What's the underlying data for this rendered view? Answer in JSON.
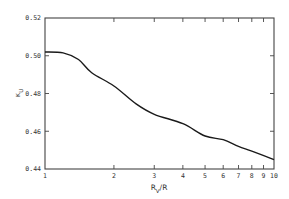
{
  "chart_data": {
    "type": "line",
    "title": "",
    "xlabel": "R_V/R",
    "ylabel": "κ_U",
    "xscale": "log",
    "xlim": [
      1,
      10
    ],
    "ylim": [
      0.44,
      0.52
    ],
    "grid": false,
    "legend": null,
    "x_ticks": [
      "1",
      "2",
      "3",
      "4",
      "5",
      "6",
      "7",
      "8",
      "9",
      "10"
    ],
    "y_ticks": [
      "0.44",
      "0.46",
      "0.48",
      "0.50",
      "0.52"
    ],
    "series": [
      {
        "name": "κ_U",
        "x": [
          1.0,
          1.2,
          1.4,
          1.6,
          2.0,
          2.5,
          3.0,
          4.0,
          5.0,
          6.0,
          7.0,
          8.0,
          10.0
        ],
        "y": [
          0.502,
          0.5015,
          0.498,
          0.491,
          0.484,
          0.4745,
          0.469,
          0.464,
          0.4575,
          0.4555,
          0.452,
          0.4495,
          0.445
        ]
      }
    ]
  },
  "colors": {
    "line": "#1a1a1a",
    "axis": "#444444",
    "text": "#333333"
  }
}
